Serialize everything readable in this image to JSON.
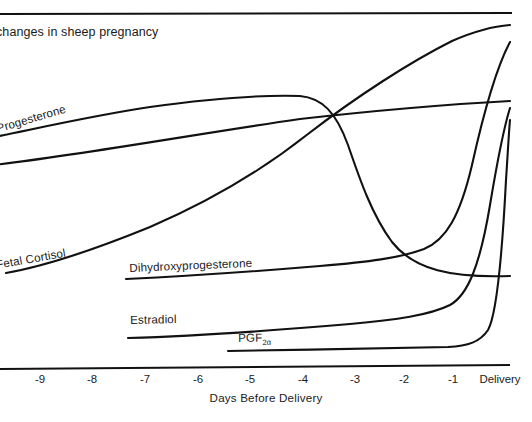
{
  "figure": {
    "title": "changes in sheep pregnancy",
    "title_note": "left-clipped at image edge",
    "axis_title": "Days Before Delivery"
  },
  "axis": {
    "tick_labels": [
      "-9",
      "-8",
      "-7",
      "-6",
      "-5",
      "-4",
      "-3",
      "-2",
      "-1",
      "Delivery"
    ],
    "tick_x": [
      40,
      92,
      145,
      198,
      250,
      303,
      355,
      404,
      453,
      500
    ]
  },
  "series_labels": {
    "progesterone": "Progesterone",
    "fetal_cortisol": "Fetal Cortisol",
    "dihydroxyprogesterone": "Dihydroxyprogesterone",
    "estradiol": "Estradiol",
    "pgf": "PGF",
    "pgf_subscript": "2α"
  },
  "colors": {
    "ink": "#111111",
    "background": "#ffffff"
  },
  "chart_data": {
    "type": "line",
    "title": "changes in sheep pregnancy",
    "xlabel": "Days Before Delivery",
    "ylabel": "",
    "grid": false,
    "legend": "inline-curve-labels",
    "xlim": [
      -9.6,
      0.4
    ],
    "ylim": [
      0,
      100
    ],
    "x_tick_labels": [
      "-9",
      "-8",
      "-7",
      "-6",
      "-5",
      "-4",
      "-3",
      "-2",
      "-1",
      "Delivery"
    ],
    "x": [
      -9.6,
      -9,
      -8,
      -7,
      -6,
      -5,
      -4,
      -3,
      -2.5,
      -2,
      -1.5,
      -1,
      -0.5,
      -0.2,
      0
    ],
    "series": [
      {
        "name": "Progesterone",
        "values": [
          67,
          69,
          74,
          78,
          81,
          83,
          84,
          83,
          76,
          58,
          40,
          29,
          24,
          22,
          21
        ],
        "note": "high plateau through -4 then abrupt prepartum fall"
      },
      {
        "name": "Fetal Cortisol",
        "values": [
          12,
          13,
          16,
          20,
          25,
          31,
          39,
          48,
          55,
          62,
          71,
          80,
          88,
          93,
          96
        ],
        "note": "progressive exponential rise to delivery"
      },
      {
        "name": "Dihydroxyprogesterone",
        "values": [
          null,
          null,
          11,
          12,
          13,
          14,
          15,
          17,
          18,
          20,
          24,
          33,
          58,
          80,
          93
        ],
        "note": "flat baseline from day -7, sharp terminal rise"
      },
      {
        "name": "Estradiol",
        "values": [
          null,
          null,
          3,
          4,
          4,
          5,
          5,
          6,
          7,
          8,
          9,
          11,
          22,
          52,
          80
        ],
        "note": "low until last day, then steep peak at delivery"
      },
      {
        "name": "PGF2α",
        "values": [
          null,
          null,
          null,
          null,
          null,
          2,
          2,
          3,
          3,
          3,
          4,
          4,
          6,
          28,
          75
        ],
        "note": "flat from day -5, abrupt surge at delivery"
      },
      {
        "name": "unlabeled-linear-trend",
        "values": [
          44,
          46,
          50,
          54,
          58,
          62,
          65,
          69,
          71,
          73,
          75,
          77,
          79,
          80,
          81
        ],
        "note": "near-straight ascending line crossing the other curves"
      }
    ]
  }
}
